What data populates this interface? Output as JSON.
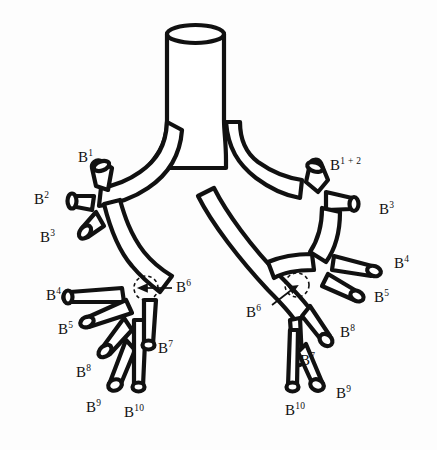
{
  "figure": {
    "background_color": "#fdfdfd",
    "stroke_color": "#111111",
    "fill_color": "#ffffff"
  },
  "labels": {
    "left_b1": {
      "base": "B",
      "sup": "1"
    },
    "left_b2": {
      "base": "B",
      "sup": "2"
    },
    "left_b3": {
      "base": "B",
      "sup": "3"
    },
    "left_b4": {
      "base": "B",
      "sup": "4"
    },
    "left_b5": {
      "base": "B",
      "sup": "5"
    },
    "left_b6": {
      "base": "B",
      "sup": "6"
    },
    "left_b7": {
      "base": "B",
      "sup": "7"
    },
    "left_b8": {
      "base": "B",
      "sup": "8"
    },
    "left_b9": {
      "base": "B",
      "sup": "9"
    },
    "left_b10": {
      "base": "B",
      "sup": "10"
    },
    "right_b1p2": {
      "base": "B",
      "sup": "1 + 2"
    },
    "right_b3": {
      "base": "B",
      "sup": "3"
    },
    "right_b4": {
      "base": "B",
      "sup": "4"
    },
    "right_b5": {
      "base": "B",
      "sup": "5"
    },
    "right_b6": {
      "base": "B",
      "sup": "6"
    },
    "right_b7": {
      "base": "B",
      "sup": "7"
    },
    "right_b8": {
      "base": "B",
      "sup": "8"
    },
    "right_b9": {
      "base": "B",
      "sup": "9"
    },
    "right_b10": {
      "base": "B",
      "sup": "10"
    }
  },
  "annotations": {
    "left_b6_marker": "dashed-circle",
    "right_b6_marker": "dashed-circle",
    "left_b6_leader": "arrow-pointing-left",
    "right_b6_leader": "arrow-pointing-upright"
  }
}
